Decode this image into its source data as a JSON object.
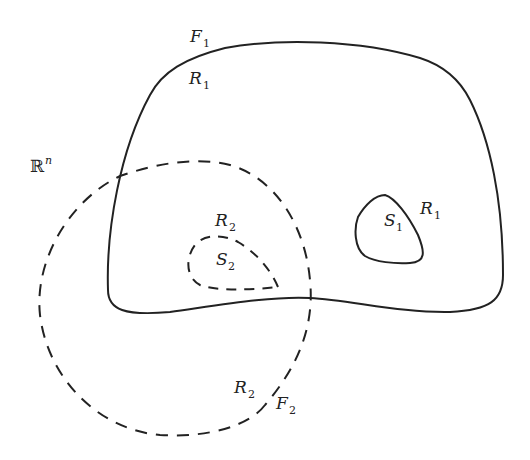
{
  "diagram": {
    "space_label": {
      "base": "ℝ",
      "sup": "n"
    },
    "regions": [
      {
        "id": "F1",
        "label": "F",
        "sub": "1",
        "style": "solid"
      },
      {
        "id": "F2",
        "label": "F",
        "sub": "2",
        "style": "dashed"
      },
      {
        "id": "S1",
        "label": "S",
        "sub": "1",
        "style": "solid"
      },
      {
        "id": "S2",
        "label": "S",
        "sub": "2",
        "style": "dashed"
      }
    ],
    "labels": {
      "F1": {
        "main": "F",
        "sub": "1"
      },
      "R1_top": {
        "main": "R",
        "sub": "1"
      },
      "R1_right": {
        "main": "R",
        "sub": "1"
      },
      "S1": {
        "main": "S",
        "sub": "1"
      },
      "R2_top": {
        "main": "R",
        "sub": "2"
      },
      "S2": {
        "main": "S",
        "sub": "2"
      },
      "R2_bottom": {
        "main": "R",
        "sub": "2"
      },
      "F2": {
        "main": "F",
        "sub": "2"
      }
    },
    "colors": {
      "stroke": "#222222",
      "background": "#ffffff"
    }
  }
}
